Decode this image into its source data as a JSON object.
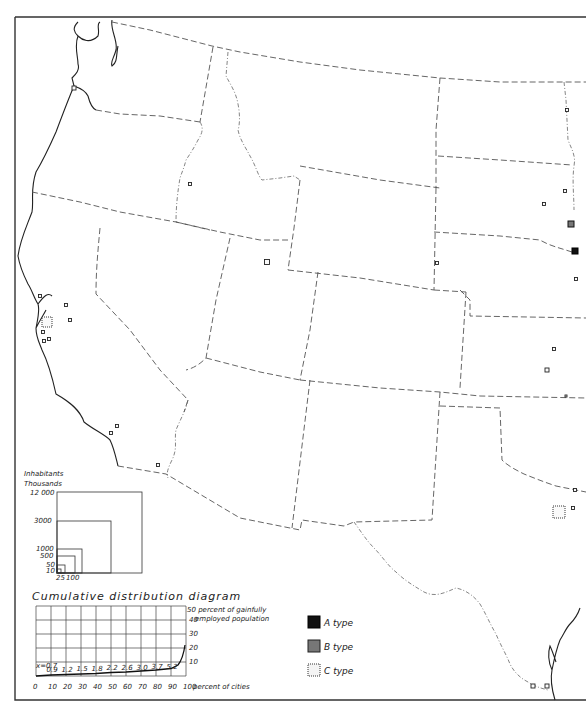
{
  "map": {
    "title": "",
    "legend": {
      "items": [
        {
          "key": "A",
          "label": "A type",
          "color": "#111111"
        },
        {
          "key": "B",
          "label": "B type",
          "color": "#777777"
        },
        {
          "key": "C",
          "label": "C type",
          "color": "#fafafa"
        }
      ]
    },
    "cities": [
      {
        "type": "C",
        "x": 74,
        "y": 88,
        "size": 4
      },
      {
        "type": "C",
        "x": 190,
        "y": 184,
        "size": 3
      },
      {
        "type": "C",
        "x": 267,
        "y": 262,
        "size": 5
      },
      {
        "type": "C",
        "x": 40,
        "y": 296,
        "size": 3
      },
      {
        "type": "C",
        "x": 66,
        "y": 305,
        "size": 3
      },
      {
        "type": "C",
        "x": 70,
        "y": 320,
        "size": 3
      },
      {
        "type": "C",
        "x": 47,
        "y": 322,
        "size": 10,
        "shaded": true
      },
      {
        "type": "C",
        "x": 43,
        "y": 332,
        "size": 3
      },
      {
        "type": "C",
        "x": 49,
        "y": 339,
        "size": 3
      },
      {
        "type": "C",
        "x": 44,
        "y": 341,
        "size": 3
      },
      {
        "type": "C",
        "x": 117,
        "y": 426,
        "size": 3
      },
      {
        "type": "C",
        "x": 111,
        "y": 433,
        "size": 3
      },
      {
        "type": "C",
        "x": 158,
        "y": 465,
        "size": 3
      },
      {
        "type": "C",
        "x": 567,
        "y": 110,
        "size": 3
      },
      {
        "type": "C",
        "x": 565,
        "y": 191,
        "size": 3
      },
      {
        "type": "C",
        "x": 544,
        "y": 204,
        "size": 3
      },
      {
        "type": "B",
        "x": 571,
        "y": 224,
        "size": 6
      },
      {
        "type": "A",
        "x": 575,
        "y": 251,
        "size": 6
      },
      {
        "type": "C",
        "x": 437,
        "y": 263,
        "size": 3
      },
      {
        "type": "C",
        "x": 576,
        "y": 279,
        "size": 3
      },
      {
        "type": "C",
        "x": 554,
        "y": 349,
        "size": 3
      },
      {
        "type": "C",
        "x": 547,
        "y": 370,
        "size": 4
      },
      {
        "type": "C",
        "x": 566,
        "y": 396,
        "size": 2
      },
      {
        "type": "C",
        "x": 575,
        "y": 490,
        "size": 3
      },
      {
        "type": "C",
        "x": 559,
        "y": 512,
        "size": 12,
        "shaded": true
      },
      {
        "type": "C",
        "x": 573,
        "y": 508,
        "size": 3
      },
      {
        "type": "C",
        "x": 533,
        "y": 686,
        "size": 4
      },
      {
        "type": "C",
        "x": 547,
        "y": 686,
        "size": 4
      }
    ]
  },
  "size_diagram": {
    "title_line1": "Inhabitants",
    "title_line2": "Thousands",
    "y_labels": [
      "12 000",
      "3000",
      "1000",
      "500",
      "50",
      "10"
    ],
    "x_labels": [
      "25",
      "100"
    ]
  },
  "chart_data": {
    "type": "line",
    "title": "Cumulative distribution diagram",
    "xlabel": "percent of cities",
    "ylabel": "percent of gainfully employed population",
    "x_ticks": [
      0,
      10,
      20,
      30,
      40,
      50,
      60,
      70,
      80,
      90,
      100
    ],
    "y_ticks": [
      10,
      20,
      30,
      40,
      50
    ],
    "xlim": [
      0,
      100
    ],
    "ylim": [
      0,
      50
    ],
    "grid": true,
    "annotations": [
      "x=0.7",
      "0.9",
      "1.2",
      "1.5",
      "1.8",
      "2.2",
      "2.6",
      "3.0",
      "3.7",
      "5.2"
    ],
    "series": [
      {
        "name": "cumulative",
        "x": [
          0,
          10,
          20,
          30,
          40,
          50,
          60,
          70,
          80,
          90,
          95,
          100
        ],
        "y": [
          0.7,
          0.9,
          1.2,
          1.5,
          1.8,
          2.2,
          2.6,
          3.0,
          3.7,
          5.2,
          8,
          20
        ]
      }
    ]
  },
  "cumulative_diagram": {
    "title": "Cumulative distribution diagram",
    "y_axis_title_line1": "50 percent of gainfully",
    "y_axis_title_line2": "employed population",
    "y_ticks": [
      "40",
      "30",
      "20",
      "10"
    ],
    "x_ticks": [
      "0",
      "10",
      "20",
      "30",
      "40",
      "50",
      "60",
      "70",
      "80",
      "90",
      "100"
    ],
    "x_axis_suffix": "percent of cities",
    "x_start_note": "x=0.7",
    "point_labels": [
      "0.9",
      "1.2",
      "1.5",
      "1.8",
      "2.2",
      "2.6",
      "3.0",
      "3.7",
      "5.2"
    ]
  }
}
